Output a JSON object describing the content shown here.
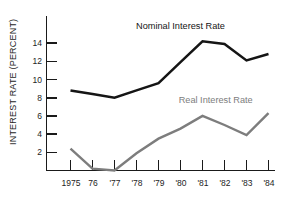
{
  "chart_data": {
    "type": "line",
    "title": "",
    "xlabel": "",
    "ylabel": "INTEREST RATE (PERCENT)",
    "ylim": [
      0,
      15
    ],
    "xlim": [
      1975,
      1984
    ],
    "grid": false,
    "legend_position": "inline-annotations",
    "x": [
      1975,
      1976,
      1977,
      1978,
      1979,
      1980,
      1981,
      1982,
      1983,
      1984
    ],
    "categories": [
      "1975",
      "76",
      "'77",
      "'78",
      "'79",
      "'80",
      "'81",
      "'82",
      "'83",
      "'84"
    ],
    "ytick_labels": [
      "2",
      "4",
      "6",
      "8",
      "10",
      "12",
      "14"
    ],
    "ytick_values": [
      2,
      4,
      6,
      8,
      10,
      12,
      14
    ],
    "series": [
      {
        "name": "Nominal Interest Rate",
        "color": "#151515",
        "values": [
          8.8,
          8.4,
          8.0,
          8.8,
          9.6,
          11.9,
          14.2,
          13.9,
          12.1,
          12.8
        ]
      },
      {
        "name": "Real Interest Rate",
        "color": "#7d7d7d",
        "values": [
          2.4,
          0.2,
          0.0,
          1.9,
          3.5,
          4.6,
          6.0,
          5.0,
          3.9,
          6.3
        ]
      }
    ],
    "annotations": [
      {
        "text": "Nominal Interest Rate",
        "x": 1980.0,
        "y": 15.6,
        "color": "#151515"
      },
      {
        "text": "Real Interest Rate",
        "x": 1981.6,
        "y": 7.4,
        "color": "#7d7d7d"
      }
    ]
  }
}
